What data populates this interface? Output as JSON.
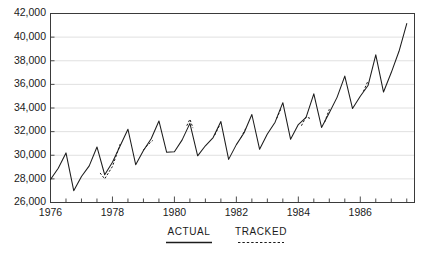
{
  "chart_data": {
    "type": "line",
    "title": "",
    "subtitle": "",
    "xlabel": "",
    "ylabel": "",
    "xlim": [
      1976.0,
      1987.75
    ],
    "ylim": [
      26000,
      42000
    ],
    "grid": true,
    "grid_axis": "y",
    "legend_position": "below-axis",
    "y_ticks": [
      26000,
      28000,
      30000,
      32000,
      34000,
      36000,
      38000,
      40000,
      42000
    ],
    "y_tick_labels": [
      "26,000",
      "28,000",
      "30,000",
      "32,000",
      "34,000",
      "36,000",
      "38,000",
      "40,000",
      "42,000"
    ],
    "x_ticks": [
      1976,
      1978,
      1980,
      1982,
      1984,
      1986
    ],
    "x_tick_labels": [
      "1976",
      "1978",
      "1980",
      "1982",
      "1984",
      "1986"
    ],
    "x_minor_tick_interval": 0.5,
    "legend": [
      {
        "name": "ACTUAL",
        "style": "solid"
      },
      {
        "name": "TRACKED",
        "style": "dashed"
      }
    ],
    "series": [
      {
        "name": "ACTUAL",
        "style": "solid",
        "x": [
          1976.0,
          1976.25,
          1976.5,
          1976.75,
          1977.0,
          1977.25,
          1977.5,
          1977.75,
          1978.0,
          1978.25,
          1978.5,
          1978.75,
          1979.0,
          1979.25,
          1979.5,
          1979.75,
          1980.0,
          1980.25,
          1980.5,
          1980.75,
          1981.0,
          1981.25,
          1981.5,
          1981.75,
          1982.0,
          1982.25,
          1982.5,
          1982.75,
          1983.0,
          1983.25,
          1983.5,
          1983.75,
          1984.0,
          1984.25,
          1984.5,
          1984.75,
          1985.0,
          1985.25,
          1985.5,
          1985.75,
          1986.0,
          1986.25,
          1986.5,
          1986.75,
          1987.0,
          1987.25,
          1987.5
        ],
        "values": [
          27950,
          28900,
          30200,
          27000,
          28200,
          29100,
          30700,
          28350,
          29400,
          30800,
          32200,
          29200,
          30400,
          31400,
          32900,
          30250,
          30300,
          31300,
          32700,
          29950,
          30800,
          31500,
          32850,
          29650,
          30900,
          31900,
          33450,
          30500,
          31800,
          32800,
          34450,
          31350,
          32600,
          33200,
          35200,
          32350,
          33600,
          34900,
          36700,
          33950,
          35000,
          35900,
          38500,
          35350,
          37000,
          38800,
          41150
        ]
      },
      {
        "name": "TRACKED",
        "style": "dashed",
        "x": [
          1977.6,
          1977.75,
          1978.0,
          1978.25,
          1979.0,
          1979.15,
          1979.3,
          1980.4,
          1980.5,
          1980.6,
          1981.3,
          1981.45,
          1982.15,
          1982.3,
          1983.3,
          1983.45,
          1984.1,
          1984.25,
          1984.4,
          1984.85,
          1985.0,
          1986.1,
          1986.25
        ],
        "values": [
          28500,
          28000,
          29050,
          30950,
          30450,
          30900,
          31250,
          32500,
          33050,
          32300,
          31700,
          32500,
          31500,
          32250,
          33100,
          34000,
          32500,
          33250,
          33100,
          32800,
          33900,
          35400,
          36300
        ]
      }
    ]
  }
}
